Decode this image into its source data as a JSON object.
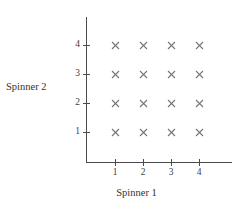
{
  "chart_data": {
    "type": "scatter",
    "title": "",
    "xlabel": "Spinner 1",
    "ylabel": "Spinner 2",
    "xlim": [
      0,
      4.6
    ],
    "ylim": [
      0,
      4.6
    ],
    "grid": false,
    "legend": null,
    "x_tick_labels": [
      "1",
      "2",
      "3",
      "4"
    ],
    "y_tick_labels": [
      "1",
      "2",
      "3",
      "4"
    ],
    "x_ticks": [
      1,
      2,
      3,
      4
    ],
    "y_ticks": [
      1,
      2,
      3,
      4
    ],
    "marker": "x",
    "marker_color": "#757575",
    "axis_color": "#4a4a4a",
    "background_color": "#ffffff",
    "points": [
      {
        "x": 1,
        "y": 1
      },
      {
        "x": 2,
        "y": 1
      },
      {
        "x": 3,
        "y": 1
      },
      {
        "x": 4,
        "y": 1
      },
      {
        "x": 1,
        "y": 2
      },
      {
        "x": 2,
        "y": 2
      },
      {
        "x": 3,
        "y": 2
      },
      {
        "x": 4,
        "y": 2
      },
      {
        "x": 1,
        "y": 3
      },
      {
        "x": 2,
        "y": 3
      },
      {
        "x": 3,
        "y": 3
      },
      {
        "x": 4,
        "y": 3
      },
      {
        "x": 1,
        "y": 4
      },
      {
        "x": 2,
        "y": 4
      },
      {
        "x": 3,
        "y": 4
      },
      {
        "x": 4,
        "y": 4
      }
    ]
  },
  "axes": {
    "x_title": "Spinner 1",
    "y_title": "Spinner 2"
  },
  "x_tick_labels": [
    "1",
    "2",
    "3",
    "4"
  ],
  "y_tick_labels": [
    "4",
    "3",
    "2",
    "1"
  ]
}
